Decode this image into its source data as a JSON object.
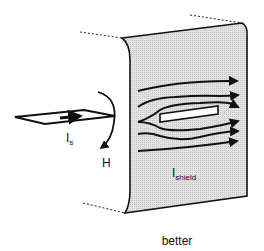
{
  "diagram": {
    "caption": "better",
    "labels": {
      "source_current": "I",
      "source_current_sub": "s",
      "magnetic_field": "H",
      "shield_current": "I",
      "shield_current_sub": "shield"
    },
    "colors": {
      "panel_fill": "#d9d9d9",
      "stroke": "#111111",
      "background": "#ffffff"
    }
  }
}
